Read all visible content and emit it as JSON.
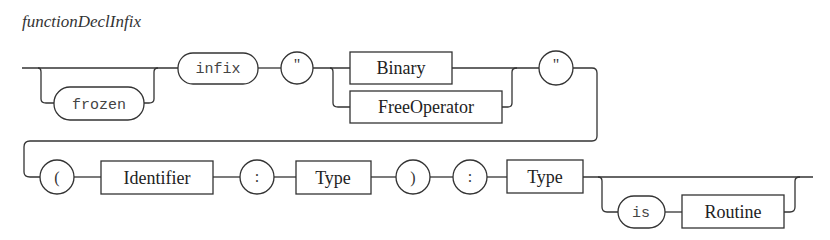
{
  "diagram": {
    "title": "functionDeclInfix",
    "row1": {
      "optional_terminal": "frozen",
      "keyword": "infix",
      "open_quote": "\"",
      "choice": [
        "Binary",
        "FreeOperator"
      ],
      "close_quote": "\""
    },
    "row2": {
      "open_paren": "(",
      "param_name": "Identifier",
      "param_colon": ":",
      "param_type": "Type",
      "close_paren": ")",
      "return_colon": ":",
      "return_type": "Type",
      "optional_keyword": "is",
      "optional_body": "Routine"
    }
  }
}
